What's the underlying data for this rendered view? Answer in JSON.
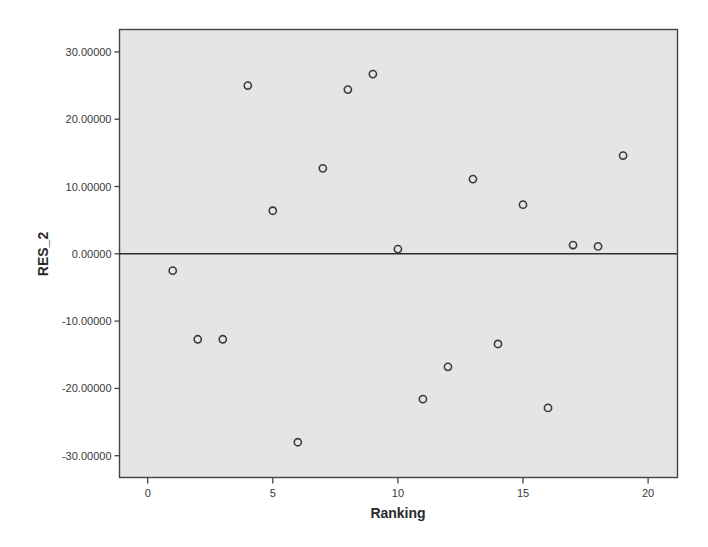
{
  "chart_data": {
    "type": "scatter",
    "title": "",
    "xlabel": "Ranking",
    "ylabel": "RES_2",
    "xlim": [
      -1.1,
      21.2
    ],
    "ylim": [
      -33.2,
      33.5
    ],
    "x_ticks": [
      0,
      5,
      10,
      15,
      20
    ],
    "x_tick_labels": [
      "0",
      "5",
      "10",
      "15",
      "20"
    ],
    "y_ticks": [
      30,
      20,
      10,
      0,
      -10,
      -20,
      -30
    ],
    "y_tick_labels": [
      "30.00000",
      "20.00000",
      "10.00000",
      "0.00000",
      "-10.00000",
      "-20.00000",
      "-30.00000"
    ],
    "grid": false,
    "legend": null,
    "reference_line": {
      "axis": "y",
      "value": 0
    },
    "marker": "open-circle",
    "series": [
      {
        "name": "RES_2",
        "points": [
          {
            "x": 1,
            "y": -2.5
          },
          {
            "x": 2,
            "y": -12.7
          },
          {
            "x": 3,
            "y": -12.7
          },
          {
            "x": 4,
            "y": 25.0
          },
          {
            "x": 5,
            "y": 6.4
          },
          {
            "x": 6,
            "y": -28.0
          },
          {
            "x": 7,
            "y": 12.7
          },
          {
            "x": 8,
            "y": 24.4
          },
          {
            "x": 9,
            "y": 26.7
          },
          {
            "x": 10,
            "y": 0.7
          },
          {
            "x": 11,
            "y": -21.6
          },
          {
            "x": 12,
            "y": -16.8
          },
          {
            "x": 13,
            "y": 11.1
          },
          {
            "x": 14,
            "y": -13.4
          },
          {
            "x": 15,
            "y": 7.3
          },
          {
            "x": 16,
            "y": -22.9
          },
          {
            "x": 17,
            "y": 1.3
          },
          {
            "x": 18,
            "y": 1.1
          },
          {
            "x": 19,
            "y": 14.6
          }
        ]
      }
    ],
    "colors": {
      "plot_background": "#e5e5e5",
      "frame": "#444444",
      "marker_stroke": "#3b3b3b",
      "reference_line": "#2e2e2e",
      "page_background": "#ffffff"
    }
  }
}
